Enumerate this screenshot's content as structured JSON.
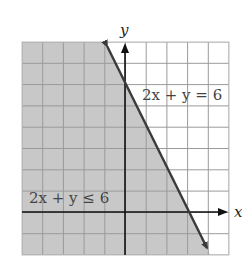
{
  "chart_data": {
    "type": "area",
    "title": "",
    "xlabel": "x",
    "ylabel": "y",
    "xlim": [
      -5,
      5
    ],
    "ylim": [
      -2,
      8
    ],
    "grid": true,
    "grid_step": 1,
    "tick_labels_shown": false,
    "boundary_line": {
      "equation": "2x + y = 6",
      "slope": -2,
      "y_intercept": 6,
      "x_intercept": 3,
      "style": "solid",
      "arrows": "both"
    },
    "shaded_region": {
      "inequality": "2x + y ≤ 6",
      "side": "below-left of line"
    },
    "annotations": [
      {
        "text": "2x + y = 6",
        "position": "right of line near y-axis, y≈6.5"
      },
      {
        "text": "2x + y ≤ 6",
        "position": "lower-left, just above x-axis"
      }
    ]
  },
  "labels": {
    "x_axis": "x",
    "y_axis": "y",
    "line_label": "2x + y = 6",
    "region_label": "2x + y ≤ 6"
  },
  "colors": {
    "shade": "#c8c8c8",
    "grid_line": "#8a8a8a",
    "grid_line_unshaded": "#cfcfcf",
    "boundary_line": "#3a3a3a",
    "axes": "#111111",
    "label_text": "#444444"
  }
}
